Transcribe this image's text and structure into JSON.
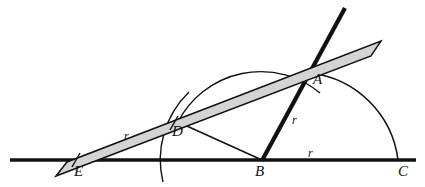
{
  "figure": {
    "canvas": {
      "width": 425,
      "height": 187
    },
    "colors": {
      "ink": "#111111",
      "ruler_fill": "#d4d4d4",
      "ruler_stroke": "#111111",
      "arc_stroke": "#111111",
      "background": "#ffffff"
    },
    "points": [
      {
        "id": "A",
        "label": "A",
        "x": 310,
        "y": 73,
        "label_x": 313,
        "label_y": 76
      },
      {
        "id": "B",
        "label": "B",
        "x": 262,
        "y": 160,
        "label_x": 256,
        "label_y": 166
      },
      {
        "id": "C",
        "label": "C",
        "x": 398,
        "y": 160,
        "label_x": 398,
        "label_y": 166
      },
      {
        "id": "D",
        "label": "D",
        "x": 178,
        "y": 122,
        "label_x": 173,
        "label_y": 127
      },
      {
        "id": "E",
        "label": "E",
        "x": 82,
        "y": 160,
        "label_x": 75,
        "label_y": 166
      }
    ],
    "radius_labels": [
      {
        "id": "r-on-ruler",
        "label": "r",
        "x": 124,
        "y": 131
      },
      {
        "id": "r-on-line-ba",
        "label": "r",
        "x": 292,
        "y": 116
      },
      {
        "id": "r-on-baseline",
        "label": "r",
        "x": 308,
        "y": 149
      }
    ],
    "elements": {
      "baseline": {
        "name": "baseline-EBC",
        "x1": 10,
        "y1": 160,
        "x2": 416,
        "y2": 160,
        "width": 3.2
      },
      "thick_line_ba": {
        "name": "line-B-A-extended",
        "x1": 262,
        "y1": 160,
        "x2": 345,
        "y2": 8,
        "width": 4.2
      },
      "segment_db": {
        "name": "segment-D-B",
        "x1": 178,
        "y1": 122,
        "x2": 262,
        "y2": 160,
        "width": 1.5
      },
      "segment_ba": {
        "name": "segment-B-A",
        "x1": 262,
        "y1": 160,
        "x2": 310,
        "y2": 73,
        "width": 1.5
      },
      "ruler": {
        "name": "straightedge-ruler",
        "angle_deg": -21.3,
        "corners": "56,176 67,163 381,41 372,56"
      },
      "ruler_ticks": [
        {
          "name": "ruler-tick-E",
          "x1": 73,
          "y1": 166,
          "x2": 80,
          "y2": 153
        },
        {
          "name": "ruler-tick-D",
          "x1": 170,
          "y1": 129,
          "x2": 177,
          "y2": 115
        }
      ],
      "arcs": [
        {
          "name": "arc-semicircle-over-D",
          "path": "M 178 122 A 93 93 0 0 1 320 93",
          "width": 1.4
        },
        {
          "name": "arc-A-to-C",
          "path": "M 310 73 A 100 100 0 0 1 398 160",
          "width": 1.6
        },
        {
          "name": "arc-through-D-crossing-baseline",
          "path": "M 188 93 A 93 93 0 0 0 164 181",
          "width": 1.4
        }
      ]
    }
  }
}
